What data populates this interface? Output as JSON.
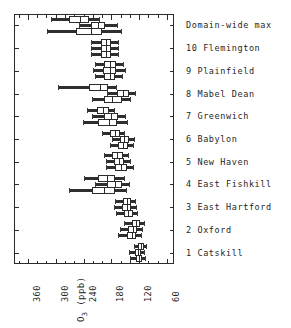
{
  "chart_data": {
    "type": "box",
    "title": "",
    "orientation": "horizontal",
    "xlabel": "O3 (ppb)",
    "xlabel_parts": {
      "base": "O",
      "sub": "3",
      "unit": " (ppb)"
    },
    "ylabel": "",
    "xlim": [
      390,
      45
    ],
    "x_inverted": true,
    "xticks": [
      360,
      300,
      240,
      180,
      120,
      60
    ],
    "xtick_labels": [
      "360",
      "300",
      "240",
      "180",
      "120",
      "60"
    ],
    "minor_tick_step": 20,
    "grid": false,
    "legend": null,
    "categories": [
      "Domain-wide max",
      "10 Flemington",
      "9 Plainfield",
      "8 Mabel Dean",
      "7 Greenwich",
      "6 Babylon",
      "5 New Haven",
      "4 East Fishkill",
      "3 East Hartford",
      "2 Oxford",
      "1 Catskill"
    ],
    "series_per_category": 3,
    "boxes": [
      {
        "category": "Domain-wide max",
        "group": 0,
        "whisker_low": 310,
        "q1": 272,
        "median": 248,
        "q3": 228,
        "whisker_high": 205
      },
      {
        "category": "Domain-wide max",
        "group": 1,
        "whisker_low": 250,
        "q1": 224,
        "median": 208,
        "q3": 193,
        "whisker_high": 165
      },
      {
        "category": "Domain-wide max",
        "group": 2,
        "whisker_low": 318,
        "q1": 256,
        "median": 223,
        "q3": 200,
        "whisker_high": 158
      },
      {
        "category": "10 Flemington",
        "group": 0,
        "whisker_low": 224,
        "q1": 203,
        "median": 192,
        "q3": 180,
        "whisker_high": 163
      },
      {
        "category": "10 Flemington",
        "group": 1,
        "whisker_low": 224,
        "q1": 203,
        "median": 191,
        "q3": 180,
        "whisker_high": 163
      },
      {
        "category": "10 Flemington",
        "group": 2,
        "whisker_low": 224,
        "q1": 203,
        "median": 191,
        "q3": 180,
        "whisker_high": 163
      },
      {
        "category": "9 Plainfield",
        "group": 0,
        "whisker_low": 216,
        "q1": 196,
        "median": 183,
        "q3": 171,
        "whisker_high": 152
      },
      {
        "category": "9 Plainfield",
        "group": 1,
        "whisker_low": 220,
        "q1": 197,
        "median": 183,
        "q3": 170,
        "whisker_high": 148
      },
      {
        "category": "9 Plainfield",
        "group": 2,
        "whisker_low": 216,
        "q1": 196,
        "median": 184,
        "q3": 172,
        "whisker_high": 154
      },
      {
        "category": "8 Mabel Dean",
        "group": 0,
        "whisker_low": 296,
        "q1": 228,
        "median": 205,
        "q3": 188,
        "whisker_high": 168
      },
      {
        "category": "8 Mabel Dean",
        "group": 1,
        "whisker_low": 190,
        "q1": 168,
        "median": 155,
        "q3": 143,
        "whisker_high": 128
      },
      {
        "category": "8 Mabel Dean",
        "group": 2,
        "whisker_low": 222,
        "q1": 196,
        "median": 178,
        "q3": 158,
        "whisker_high": 137
      },
      {
        "category": "7 Greenwich",
        "group": 0,
        "whisker_low": 232,
        "q1": 212,
        "median": 199,
        "q3": 186,
        "whisker_high": 172
      },
      {
        "category": "7 Greenwich",
        "group": 1,
        "whisker_low": 222,
        "q1": 197,
        "median": 181,
        "q3": 165,
        "whisker_high": 148
      },
      {
        "category": "7 Greenwich",
        "group": 2,
        "whisker_low": 242,
        "q1": 208,
        "median": 186,
        "q3": 167,
        "whisker_high": 145
      },
      {
        "category": "6 Babylon",
        "group": 0,
        "whisker_low": 200,
        "q1": 184,
        "median": 173,
        "q3": 162,
        "whisker_high": 150
      },
      {
        "category": "6 Babylon",
        "group": 1,
        "whisker_low": 178,
        "q1": 162,
        "median": 152,
        "q3": 142,
        "whisker_high": 130
      },
      {
        "category": "6 Babylon",
        "group": 2,
        "whisker_low": 184,
        "q1": 166,
        "median": 155,
        "q3": 144,
        "whisker_high": 132
      },
      {
        "category": "5 New Haven",
        "group": 0,
        "whisker_low": 196,
        "q1": 178,
        "median": 167,
        "q3": 156,
        "whisker_high": 142
      },
      {
        "category": "5 New Haven",
        "group": 1,
        "whisker_low": 192,
        "q1": 174,
        "median": 163,
        "q3": 152,
        "whisker_high": 138
      },
      {
        "category": "5 New Haven",
        "group": 2,
        "whisker_low": 192,
        "q1": 172,
        "median": 159,
        "q3": 147,
        "whisker_high": 132
      },
      {
        "category": "4 East Fishkill",
        "group": 0,
        "whisker_low": 238,
        "q1": 208,
        "median": 190,
        "q3": 172,
        "whisker_high": 150
      },
      {
        "category": "4 East Fishkill",
        "group": 1,
        "whisker_low": 216,
        "q1": 190,
        "median": 173,
        "q3": 157,
        "whisker_high": 140
      },
      {
        "category": "4 East Fishkill",
        "group": 2,
        "whisker_low": 272,
        "q1": 222,
        "median": 196,
        "q3": 172,
        "whisker_high": 147
      },
      {
        "category": "3 East Hartford",
        "group": 0,
        "whisker_low": 172,
        "q1": 156,
        "median": 147,
        "q3": 138,
        "whisker_high": 127
      },
      {
        "category": "3 East Hartford",
        "group": 1,
        "whisker_low": 174,
        "q1": 157,
        "median": 147,
        "q3": 137,
        "whisker_high": 125
      },
      {
        "category": "3 East Hartford",
        "group": 2,
        "whisker_low": 170,
        "q1": 153,
        "median": 144,
        "q3": 134,
        "whisker_high": 122
      },
      {
        "category": "2 Oxford",
        "group": 0,
        "whisker_low": 152,
        "q1": 136,
        "median": 127,
        "q3": 118,
        "whisker_high": 107
      },
      {
        "category": "2 Oxford",
        "group": 1,
        "whisker_low": 162,
        "q1": 145,
        "median": 134,
        "q3": 124,
        "whisker_high": 112
      },
      {
        "category": "2 Oxford",
        "group": 2,
        "whisker_low": 166,
        "q1": 147,
        "median": 136,
        "q3": 126,
        "whisker_high": 114
      },
      {
        "category": "1 Catskill",
        "group": 0,
        "whisker_low": 132,
        "q1": 122,
        "median": 116,
        "q3": 110,
        "whisker_high": 103
      },
      {
        "category": "1 Catskill",
        "group": 1,
        "whisker_low": 142,
        "q1": 130,
        "median": 123,
        "q3": 116,
        "whisker_high": 108
      },
      {
        "category": "1 Catskill",
        "group": 2,
        "whisker_low": 140,
        "q1": 128,
        "median": 121,
        "q3": 114,
        "whisker_high": 106
      }
    ]
  },
  "axis": {
    "title_base": "O",
    "title_sub": "3",
    "title_unit": " (ppb)"
  },
  "colors": {
    "frame": "#2b2b2b",
    "box_edge": "#2b2b2b",
    "box_fill": "#ffffff",
    "whisker": "#3a3a3a",
    "text": "#1f1f1f",
    "background": "#ffffff"
  }
}
